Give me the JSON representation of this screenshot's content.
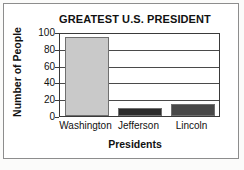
{
  "chart_data": {
    "type": "bar",
    "title": "GREATEST U.S. PRESIDENT",
    "xlabel": "Presidents",
    "ylabel": "Number of People",
    "categories": [
      "Washington",
      "Jefferson",
      "Lincoln"
    ],
    "values": [
      96,
      10,
      15
    ],
    "bar_colors": [
      "#c9c9c9",
      "#2b2b2b",
      "#484848"
    ],
    "ylim": [
      0,
      100
    ],
    "ytick_labels": [
      "0",
      "20",
      "40",
      "60",
      "80",
      "100"
    ],
    "ytick_values": [
      0,
      20,
      40,
      60,
      80,
      100
    ],
    "grid": true,
    "legend": false,
    "frame_color": "#3a3a3a",
    "background_color": "#ffffff"
  }
}
